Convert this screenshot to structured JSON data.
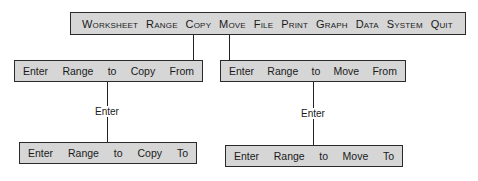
{
  "menu_bar": {
    "items": [
      "Worksheet",
      "Range",
      "Copy",
      "Move",
      "File",
      "Print",
      "Graph",
      "Data",
      "System",
      "Quit"
    ]
  },
  "copy_branch": {
    "prompt_from": [
      "Enter",
      "Range",
      "to",
      "Copy",
      "From"
    ],
    "connector_label": "Enter",
    "prompt_to": [
      "Enter",
      "Range",
      "to",
      "Copy",
      "To"
    ]
  },
  "move_branch": {
    "prompt_from": [
      "Enter",
      "Range",
      "to",
      "Move",
      "From"
    ],
    "connector_label": "Enter",
    "prompt_to": [
      "Enter",
      "Range",
      "to",
      "Move",
      "To"
    ]
  },
  "colors": {
    "box_fill": "#d6d6d6",
    "border": "#2a2a2a"
  }
}
